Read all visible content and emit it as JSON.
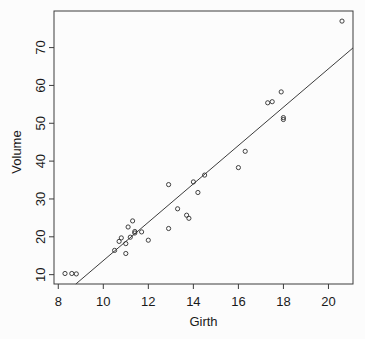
{
  "chart_data": {
    "type": "scatter",
    "title": "",
    "xlabel": "Girth",
    "ylabel": "Volume",
    "x_ticks": [
      8,
      10,
      12,
      14,
      16,
      18,
      20
    ],
    "y_ticks": [
      10,
      20,
      30,
      40,
      50,
      60,
      70
    ],
    "xlim": [
      7.81,
      21.09
    ],
    "ylim": [
      7.53,
      79.67
    ],
    "grid": false,
    "legend": "none",
    "marker": "open-circle",
    "points": [
      [
        8.3,
        10.3
      ],
      [
        8.6,
        10.3
      ],
      [
        8.8,
        10.2
      ],
      [
        10.5,
        16.4
      ],
      [
        10.7,
        18.8
      ],
      [
        10.8,
        19.7
      ],
      [
        11.0,
        15.6
      ],
      [
        11.0,
        18.2
      ],
      [
        11.1,
        22.6
      ],
      [
        11.2,
        19.9
      ],
      [
        11.3,
        24.2
      ],
      [
        11.4,
        21.0
      ],
      [
        11.4,
        21.4
      ],
      [
        11.7,
        21.3
      ],
      [
        12.0,
        19.1
      ],
      [
        12.9,
        22.2
      ],
      [
        12.9,
        33.8
      ],
      [
        13.3,
        27.4
      ],
      [
        13.7,
        25.7
      ],
      [
        13.8,
        24.9
      ],
      [
        14.0,
        34.5
      ],
      [
        14.2,
        31.7
      ],
      [
        14.5,
        36.3
      ],
      [
        16.0,
        38.3
      ],
      [
        16.3,
        42.6
      ],
      [
        17.3,
        55.4
      ],
      [
        17.5,
        55.7
      ],
      [
        17.9,
        58.3
      ],
      [
        18.0,
        51.5
      ],
      [
        18.0,
        51.0
      ],
      [
        20.6,
        77.0
      ]
    ],
    "fit_line": {
      "x1": 8.78,
      "y1": 7.53,
      "x2": 21.09,
      "y2": 69.92
    },
    "colors": {
      "marker": "#2e2e2e",
      "line": "#3c3c3c",
      "axis": "#3c3c3c",
      "text": "#1a1a1a",
      "background": "#fcfcfc"
    }
  }
}
